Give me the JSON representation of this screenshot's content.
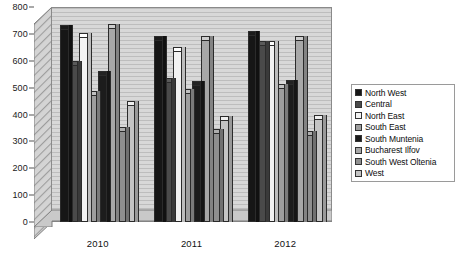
{
  "chart_data": {
    "type": "bar",
    "title": "",
    "subtitle": "",
    "xlabel": "",
    "ylabel": "",
    "categories": [
      "2010",
      "2011",
      "2012"
    ],
    "ylim": [
      0,
      800
    ],
    "y_ticks": [
      0,
      100,
      200,
      300,
      400,
      500,
      600,
      700,
      800
    ],
    "grid": true,
    "legend_position": "right",
    "style": "3d-column-grayscale",
    "series": [
      {
        "name": "North West",
        "color": "#161616",
        "values": [
          718,
          679,
          697
        ]
      },
      {
        "name": "Central",
        "color": "#4a4a4a",
        "values": [
          585,
          520,
          659
        ]
      },
      {
        "name": "North East",
        "color": "#f2f2f2",
        "values": [
          690,
          638,
          660
        ]
      },
      {
        "name": "South East",
        "color": "#9e9e9e",
        "values": [
          473,
          479,
          497
        ]
      },
      {
        "name": "South Muntenia",
        "color": "#1c1c1c",
        "values": [
          548,
          510,
          512
        ]
      },
      {
        "name": "Bucharest Ilfov",
        "color": "#a8a8a8",
        "values": [
          722,
          676,
          678
        ]
      },
      {
        "name": "South West Oltenia",
        "color": "#8f8f8f",
        "values": [
          340,
          330,
          325
        ]
      },
      {
        "name": "West",
        "color": "#c4c4c4",
        "values": [
          435,
          381,
          384
        ]
      }
    ]
  },
  "axes": {
    "y_tick_labels": [
      "800",
      "700",
      "600",
      "500",
      "400",
      "300",
      "200",
      "100",
      "0"
    ],
    "x_tick_labels": [
      "2010",
      "2011",
      "2012"
    ]
  },
  "legend": {
    "items": [
      {
        "label": "North West"
      },
      {
        "label": "Central"
      },
      {
        "label": "North East"
      },
      {
        "label": "South East"
      },
      {
        "label": "South Muntenia"
      },
      {
        "label": "Bucharest Ilfov"
      },
      {
        "label": "South West Oltenia"
      },
      {
        "label": "West"
      }
    ]
  },
  "caption": {
    "text": ""
  }
}
